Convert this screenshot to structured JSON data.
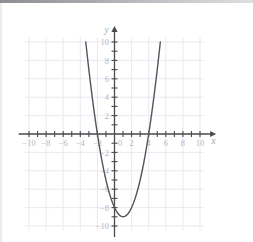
{
  "figure": {
    "type": "coordinate-plane-graph",
    "x_axis_name": "x",
    "y_axis_name": "y",
    "origin_label": "0",
    "x_tick_labels": [
      "-10",
      "-8",
      "-6",
      "-4",
      "-2",
      "2",
      "4",
      "6",
      "8",
      "10"
    ],
    "y_tick_labels": [
      "10",
      "8",
      "6",
      "4",
      "2",
      "-2",
      "-4",
      "-6",
      "-8",
      "-10"
    ],
    "colors": {
      "curve": "#55555a",
      "axis": "#4a4a4f",
      "grid": "#e9e9f0",
      "tick_label": "#b8b8bc",
      "background": "#ffffff",
      "top_bar": "#9a9a9e"
    }
  },
  "chart_data": {
    "type": "line",
    "title": "",
    "xlabel": "x",
    "ylabel": "y",
    "xlim": [
      -11,
      11
    ],
    "ylim": [
      -10.5,
      11
    ],
    "grid": true,
    "grid_step": 2,
    "tick_step": 1,
    "label_step": 2,
    "legend": "none",
    "xticks": [
      -10,
      -8,
      -6,
      -4,
      -2,
      0,
      2,
      4,
      6,
      8,
      10
    ],
    "yticks": [
      10,
      8,
      6,
      4,
      2,
      0,
      -2,
      -4,
      -6,
      -8,
      -10
    ],
    "series": [
      {
        "name": "parabola",
        "equation": "y = x^2 - 2x - 8",
        "vertex": [
          1,
          -9
        ],
        "roots": [
          -2,
          4
        ],
        "y_intercept": -8,
        "x": [
          -3.36,
          -3.2,
          -3.0,
          -2.8,
          -2.6,
          -2.4,
          -2.2,
          -2.0,
          -1.8,
          -1.6,
          -1.4,
          -1.2,
          -1.0,
          -0.8,
          -0.6,
          -0.4,
          -0.2,
          0.0,
          0.2,
          0.4,
          0.6,
          0.8,
          1.0,
          1.2,
          1.4,
          1.6,
          1.8,
          2.0,
          2.2,
          2.4,
          2.6,
          2.8,
          3.0,
          3.2,
          3.4,
          3.6,
          3.8,
          4.0,
          4.2,
          4.4,
          4.6,
          4.8,
          5.0,
          5.2,
          5.36
        ],
        "values": [
          10.0,
          8.64,
          7.0,
          5.44,
          3.96,
          2.56,
          1.24,
          0.0,
          -1.16,
          -2.24,
          -3.24,
          -4.16,
          -5.0,
          -5.76,
          -6.44,
          -7.04,
          -7.56,
          -8.0,
          -8.36,
          -8.64,
          -8.84,
          -8.96,
          -9.0,
          -8.96,
          -8.84,
          -8.64,
          -8.36,
          -8.0,
          -7.56,
          -7.04,
          -6.44,
          -5.76,
          -5.0,
          -4.16,
          -3.24,
          -2.24,
          -1.16,
          0.0,
          1.24,
          2.56,
          3.96,
          5.44,
          7.0,
          8.64,
          10.0
        ]
      }
    ]
  }
}
